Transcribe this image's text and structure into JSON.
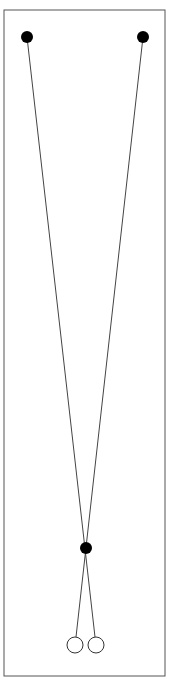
{
  "diagram": {
    "frame": {
      "x": 4,
      "y": 10,
      "width": 161,
      "height": 666,
      "stroke": "#555555"
    },
    "pivots": [
      {
        "id": "left-pivot",
        "cx": 27,
        "cy": 37,
        "r": 6,
        "fill": "#000000"
      },
      {
        "id": "right-pivot",
        "cx": 143,
        "cy": 37,
        "r": 6,
        "fill": "#000000"
      }
    ],
    "crossing_node": {
      "cx": 86,
      "cy": 548,
      "r": 6,
      "fill": "#000000"
    },
    "bobs": [
      {
        "id": "left-bob",
        "cx": 75,
        "cy": 645,
        "r": 8,
        "stroke": "#333333"
      },
      {
        "id": "right-bob",
        "cx": 96,
        "cy": 645,
        "r": 8,
        "stroke": "#333333"
      }
    ],
    "strings": [
      {
        "id": "string-left-pivot-to-right-bob",
        "x1": 27,
        "y1": 37,
        "x2": 95,
        "y2": 637
      },
      {
        "id": "string-right-pivot-to-left-bob",
        "x1": 143,
        "y1": 37,
        "x2": 76,
        "y2": 637
      }
    ],
    "line_color": "#444444"
  }
}
